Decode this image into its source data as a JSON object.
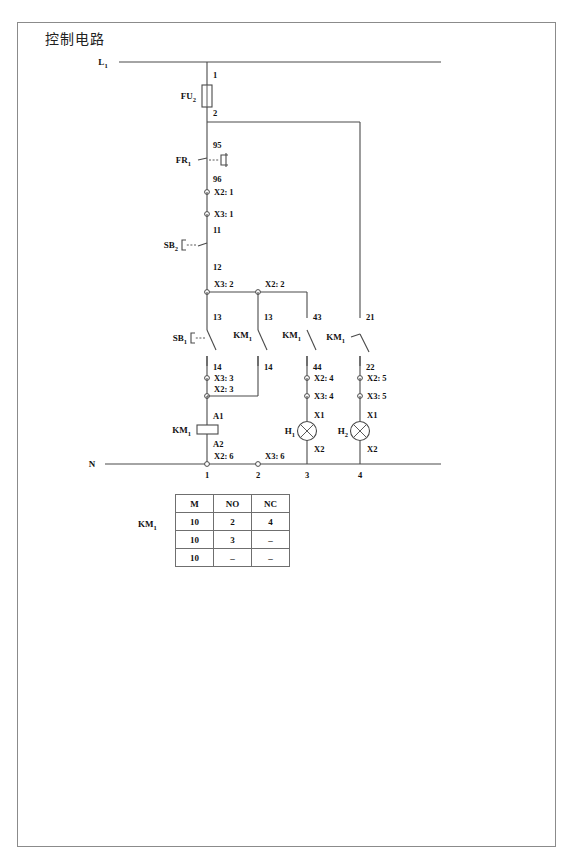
{
  "figure": {
    "title": "控制电路",
    "rails": {
      "top_label": "L",
      "top_label_sub": "1",
      "bottom_label": "N"
    }
  },
  "components": {
    "fuse": {
      "name": "FU",
      "sub": "2",
      "in_terminal": "1",
      "out_terminal": "2"
    },
    "overload_relay": {
      "name": "FR",
      "sub": "1",
      "in_terminal": "95",
      "out_terminal": "96"
    },
    "stop_button": {
      "name": "SB",
      "sub": "2",
      "in_terminal": "11",
      "out_terminal": "12"
    },
    "start_button": {
      "name": "SB",
      "sub": "1",
      "in_terminal": "13",
      "out_terminal": "14"
    },
    "holding_contact": {
      "name": "KM",
      "sub": "1",
      "in_terminal": "13",
      "out_terminal": "14"
    },
    "aux_no_contact": {
      "name": "KM",
      "sub": "1",
      "in_terminal": "43",
      "out_terminal": "44"
    },
    "aux_nc_contact": {
      "name": "KM",
      "sub": "1",
      "in_terminal": "21",
      "out_terminal": "22"
    },
    "coil": {
      "name": "KM",
      "sub": "1",
      "in_terminal": "A1",
      "out_terminal": "A2"
    },
    "lamp_1": {
      "name": "H",
      "sub": "1",
      "in_terminal": "X1",
      "out_terminal": "X2"
    },
    "lamp_2": {
      "name": "H",
      "sub": "2",
      "in_terminal": "X1",
      "out_terminal": "X2"
    }
  },
  "terminals": {
    "t_x2_1": "X2: 1",
    "t_x3_1": "X3: 1",
    "t_x3_2": "X3: 2",
    "t_x2_2": "X2: 2",
    "t_x3_3": "X3: 3",
    "t_x2_3": "X2: 3",
    "t_x2_4": "X2: 4",
    "t_x3_4": "X3: 4",
    "t_x2_5": "X2: 5",
    "t_x3_5": "X3: 5",
    "t_x2_6": "X2: 6",
    "t_x3_6": "X3: 6"
  },
  "column_numbers": [
    "1",
    "2",
    "3",
    "4"
  ],
  "contact_table": {
    "device_name": "KM",
    "device_sub": "1",
    "headers": [
      "M",
      "NO",
      "NC"
    ],
    "rows": [
      [
        "10",
        "2",
        "4"
      ],
      [
        "10",
        "3",
        "–"
      ],
      [
        "10",
        "–",
        "–"
      ]
    ]
  },
  "colors": {
    "wire": "#4a4a4a",
    "frame": "#8b8b8b",
    "text": "#111111",
    "background": "#ffffff"
  }
}
